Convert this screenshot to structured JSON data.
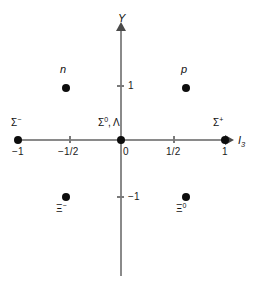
{
  "diagram": {
    "axes": {
      "y_label": "Y",
      "x_label": "I",
      "x_label_subscript": "3",
      "line_color": "#8a8a8a",
      "arrow_color": "#4a4a4a"
    },
    "x_ticks": [
      {
        "value": -1,
        "label": "−1",
        "px": 18
      },
      {
        "value": -0.5,
        "label": "−1/2",
        "px": 69
      },
      {
        "value": 0,
        "label": "0",
        "px": 121
      },
      {
        "value": 0.5,
        "label": "1/2",
        "px": 173
      },
      {
        "value": 1,
        "label": "1",
        "px": 225
      }
    ],
    "y_ticks": [
      {
        "value": 1,
        "label": "1",
        "px": 85
      },
      {
        "value": -1,
        "label": "−1",
        "px": 196
      }
    ],
    "points": [
      {
        "name": "neutron",
        "label": "n",
        "style": "italic",
        "i3": -0.5,
        "y": 1,
        "dot_x": 62,
        "dot_y": 84,
        "label_x": 60,
        "label_y": 64,
        "label_position": "above"
      },
      {
        "name": "proton",
        "label": "p",
        "style": "italic",
        "i3": 0.5,
        "y": 1,
        "dot_x": 182,
        "dot_y": 84,
        "label_x": 181,
        "label_y": 64,
        "label_position": "above"
      },
      {
        "name": "sigma-minus",
        "label": "Σ",
        "charge": "−",
        "style": "greek",
        "i3": -1,
        "y": 0,
        "dot_x": 18,
        "dot_y": 136,
        "label_x": 14,
        "label_y": 118,
        "label_position": "above"
      },
      {
        "name": "sigma-zero-lambda",
        "label": "Σ",
        "charge": "0",
        "extra": ", Λ",
        "style": "greek",
        "i3": 0,
        "y": 0,
        "dot_x": 117,
        "dot_y": 136,
        "label_x": 100,
        "label_y": 118,
        "label_position": "above"
      },
      {
        "name": "sigma-plus",
        "label": "Σ",
        "charge": "+",
        "style": "greek",
        "i3": 1,
        "y": 0,
        "dot_x": 221,
        "dot_y": 136,
        "label_x": 215,
        "label_y": 118,
        "label_position": "above"
      },
      {
        "name": "xi-minus",
        "label": "Ξ",
        "charge": "−",
        "style": "greek",
        "i3": -0.5,
        "y": -1,
        "dot_x": 62,
        "dot_y": 193,
        "label_x": 57,
        "label_y": 202,
        "label_position": "below"
      },
      {
        "name": "xi-zero",
        "label": "Ξ",
        "charge": "0",
        "style": "greek",
        "i3": 0.5,
        "y": -1,
        "dot_x": 182,
        "dot_y": 193,
        "label_x": 177,
        "label_y": 202,
        "label_position": "below"
      }
    ]
  }
}
